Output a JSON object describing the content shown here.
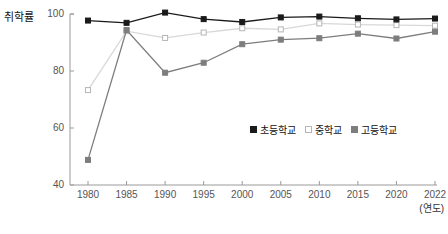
{
  "chart_data": {
    "type": "line",
    "title": "",
    "ylabel": "취학률",
    "xlabel": "(연도)",
    "categories": [
      "1980",
      "1985",
      "1990",
      "1995",
      "2000",
      "2005",
      "2010",
      "2015",
      "2020",
      "2022"
    ],
    "yticks": [
      "40",
      "60",
      "80",
      "100"
    ],
    "ylim": [
      40,
      100
    ],
    "grid": false,
    "legend_position": "inside-bottom-right",
    "series": [
      {
        "name": "초등학교",
        "marker": "filled-square",
        "color": "#1a1a1a",
        "values": [
          97.7,
          96.9,
          100.5,
          98.2,
          97.2,
          98.8,
          99.1,
          98.5,
          98.1,
          98.4
        ]
      },
      {
        "name": "중학교",
        "marker": "open-square",
        "color": "#d8d8d8",
        "values": [
          73.3,
          94.0,
          91.6,
          93.5,
          95.0,
          94.6,
          96.7,
          96.3,
          96.1,
          95.9
        ]
      },
      {
        "name": "고등학교",
        "marker": "filled-square",
        "color": "#7d7d7d",
        "values": [
          48.8,
          94.4,
          79.4,
          82.9,
          89.4,
          91.0,
          91.5,
          93.1,
          91.4,
          93.8
        ]
      }
    ]
  },
  "caption": {
    "text": ""
  }
}
